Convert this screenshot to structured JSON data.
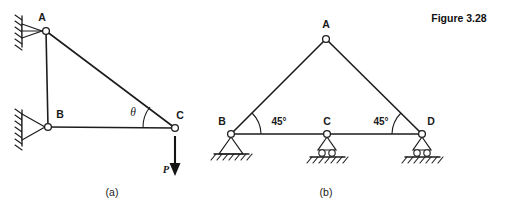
{
  "figure": {
    "caption": "Figure 3.28",
    "subfigures": [
      {
        "id": "a",
        "caption": "(a)"
      },
      {
        "id": "b",
        "caption": "(b)"
      }
    ]
  },
  "diagram_a": {
    "name": "right-triangle-truss-with-point-load",
    "nodes": [
      {
        "id": "A",
        "label": "A",
        "x": 46,
        "y": 31
      },
      {
        "id": "B",
        "label": "B",
        "x": 48,
        "y": 127
      },
      {
        "id": "C",
        "label": "C",
        "x": 175,
        "y": 128
      }
    ],
    "members": [
      {
        "from": "A",
        "to": "B"
      },
      {
        "from": "B",
        "to": "C"
      },
      {
        "from": "A",
        "to": "C"
      }
    ],
    "supports": [
      {
        "at": "A",
        "type": "pin-on-wall",
        "orientation": "left-wall"
      },
      {
        "at": "B",
        "type": "pin-on-wall",
        "orientation": "left-wall"
      }
    ],
    "angle": {
      "at": "C",
      "label": "θ",
      "between": "CB and CA"
    },
    "load": {
      "at": "C",
      "label": "P",
      "direction": "down",
      "magnitude_text": "P"
    }
  },
  "diagram_b": {
    "name": "isosceles-truss-on-three-supports",
    "nodes": [
      {
        "id": "A",
        "label": "A",
        "x": 326,
        "y": 39
      },
      {
        "id": "B",
        "label": "B",
        "x": 231,
        "y": 134
      },
      {
        "id": "C",
        "label": "C",
        "x": 327,
        "y": 134
      },
      {
        "id": "D",
        "label": "D",
        "x": 422,
        "y": 134
      }
    ],
    "members": [
      {
        "from": "A",
        "to": "B"
      },
      {
        "from": "A",
        "to": "D"
      },
      {
        "from": "B",
        "to": "C"
      },
      {
        "from": "C",
        "to": "D"
      }
    ],
    "supports": [
      {
        "at": "B",
        "type": "pin",
        "orientation": "ground"
      },
      {
        "at": "C",
        "type": "roller",
        "orientation": "ground"
      },
      {
        "at": "D",
        "type": "roller",
        "orientation": "ground"
      }
    ],
    "angles": [
      {
        "at": "B",
        "label": "45°"
      },
      {
        "at": "D",
        "label": "45°"
      }
    ]
  },
  "colors": {
    "line": "#1d1d1d",
    "text": "#1a1a1a",
    "background": "#ffffff"
  }
}
